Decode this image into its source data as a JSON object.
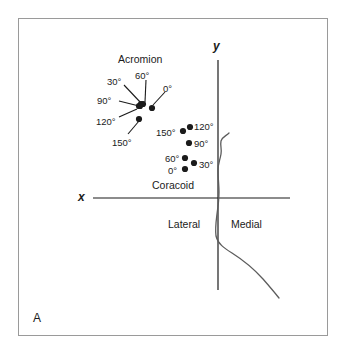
{
  "figure": {
    "panel_letter": "A",
    "background_color": "#ffffff",
    "border_color": "#9a9a9a",
    "ink_color": "#1b1b1b"
  },
  "axes": {
    "x_label": "x",
    "y_label": "y",
    "x_axis": {
      "x1": 93,
      "y1": 198,
      "x2": 290,
      "y2": 198
    },
    "y_axis": {
      "x1": 218,
      "y1": 60,
      "x2": 218,
      "y2": 290
    },
    "x_label_pos": {
      "x": 78,
      "y": 191
    },
    "y_label_pos": {
      "x": 213,
      "y": 40
    }
  },
  "anatomy_labels": [
    {
      "name": "acromion",
      "text": "Acromion",
      "x": 118,
      "y": 54
    },
    {
      "name": "coracoid",
      "text": "Coracoid",
      "x": 152,
      "y": 180
    },
    {
      "name": "lateral",
      "text": "Lateral",
      "x": 168,
      "y": 219
    },
    {
      "name": "medial",
      "text": "Medial",
      "x": 231,
      "y": 219
    }
  ],
  "acromion_cluster": {
    "points": [
      {
        "angle": "0°",
        "x": 152,
        "y": 108
      },
      {
        "angle": "30°",
        "x": 141,
        "y": 104
      },
      {
        "angle": "60°",
        "x": 143,
        "y": 104
      },
      {
        "angle": "90°",
        "x": 139,
        "y": 106
      },
      {
        "angle": "120°",
        "x": 140,
        "y": 106
      },
      {
        "angle": "150°",
        "x": 139,
        "y": 119
      }
    ],
    "labels": [
      {
        "angle": "30°",
        "x": 107,
        "y": 77
      },
      {
        "angle": "60°",
        "x": 135,
        "y": 71
      },
      {
        "angle": "0°",
        "x": 163,
        "y": 84
      },
      {
        "angle": "90°",
        "x": 97,
        "y": 96
      },
      {
        "angle": "120°",
        "x": 96,
        "y": 117
      },
      {
        "angle": "150°",
        "x": 112,
        "y": 138
      }
    ],
    "leaders": [
      {
        "x1": 124,
        "y1": 85,
        "x2": 141,
        "y2": 103
      },
      {
        "x1": 146,
        "y1": 80,
        "x2": 145,
        "y2": 102
      },
      {
        "x1": 165,
        "y1": 92,
        "x2": 153,
        "y2": 105
      },
      {
        "x1": 119,
        "y1": 101,
        "x2": 139,
        "y2": 106
      },
      {
        "x1": 119,
        "y1": 117,
        "x2": 137,
        "y2": 109
      },
      {
        "x1": 128,
        "y1": 134,
        "x2": 139,
        "y2": 121
      }
    ]
  },
  "coracoid_cluster": {
    "points": [
      {
        "angle": "150°",
        "x": 183,
        "y": 131
      },
      {
        "angle": "120°",
        "x": 190,
        "y": 127
      },
      {
        "angle": "90°",
        "x": 189,
        "y": 143
      },
      {
        "angle": "60°",
        "x": 185,
        "y": 158
      },
      {
        "angle": "30°",
        "x": 194,
        "y": 163
      },
      {
        "angle": "0°",
        "x": 185,
        "y": 169
      }
    ],
    "labels": [
      {
        "angle": "150°",
        "x": 156,
        "y": 128
      },
      {
        "angle": "120°",
        "x": 194,
        "y": 122
      },
      {
        "angle": "90°",
        "x": 194,
        "y": 139
      },
      {
        "angle": "60°",
        "x": 165,
        "y": 154
      },
      {
        "angle": "30°",
        "x": 199,
        "y": 160
      },
      {
        "angle": "0°",
        "x": 168,
        "y": 166
      }
    ]
  },
  "scapula_outline": {
    "description": "glenoid and scapular-body contour",
    "path": "M 229 133 C 226 136, 222 137, 221 141 C 220 146, 222 149, 221 154 C 220 160, 218 164, 218 170 C 218 178, 219 185, 219 192 C 219 200, 218 207, 217 214 C 216 222, 215 229, 216 236 C 218 244, 224 248, 232 253 C 243 260, 254 269, 263 279 C 270 287, 275 293, 279 298"
  }
}
